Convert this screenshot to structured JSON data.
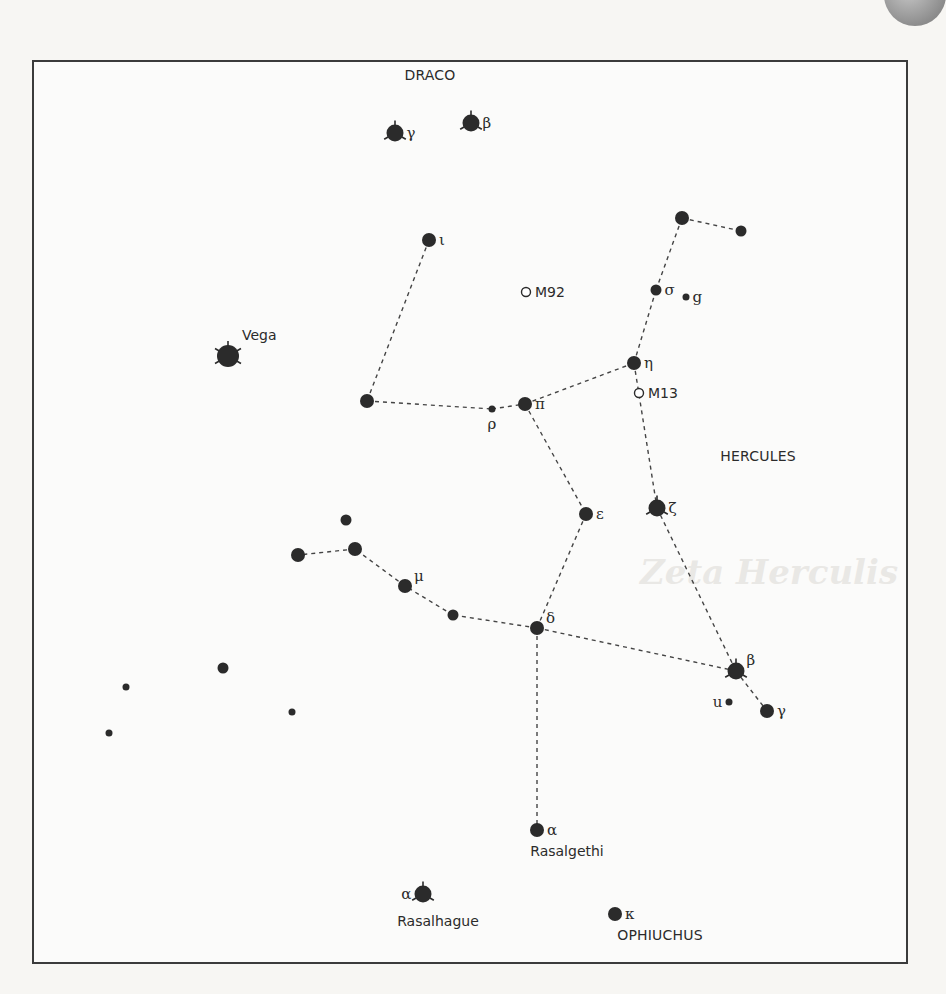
{
  "figure": {
    "constellations": [
      {
        "name": "DRACO",
        "x": 430,
        "y": 80
      },
      {
        "name": "HERCULES",
        "x": 758,
        "y": 461
      },
      {
        "name": "OPHIUCHUS",
        "x": 660,
        "y": 940
      }
    ],
    "stars": [
      {
        "id": "dra-gamma",
        "x": 395,
        "y": 133,
        "mag": "bright",
        "spiked": true,
        "label": "γ",
        "labelPos": "right"
      },
      {
        "id": "dra-beta",
        "x": 471,
        "y": 123,
        "mag": "bright",
        "spiked": true,
        "label": "β",
        "labelPos": "right"
      },
      {
        "id": "her-iota",
        "x": 429,
        "y": 240,
        "mag": "medium",
        "label": "ι",
        "labelPos": "right"
      },
      {
        "id": "vega",
        "x": 228,
        "y": 356,
        "mag": "brightest",
        "spiked": true,
        "label": "Vega",
        "labelPos": "upright",
        "named": true
      },
      {
        "id": "her-theta",
        "x": 367,
        "y": 401,
        "mag": "medium",
        "label": "",
        "labelPos": "right"
      },
      {
        "id": "her-rho",
        "x": 492,
        "y": 409,
        "mag": "small",
        "label": "ρ",
        "labelPos": "below"
      },
      {
        "id": "her-pi",
        "x": 525,
        "y": 404,
        "mag": "medium",
        "label": "π",
        "labelPos": "right"
      },
      {
        "id": "her-eta",
        "x": 634,
        "y": 363,
        "mag": "medium",
        "label": "η",
        "labelPos": "right"
      },
      {
        "id": "her-sigma",
        "x": 656,
        "y": 290,
        "mag": "medium-small",
        "label": "σ",
        "labelPos": "right"
      },
      {
        "id": "her-g",
        "x": 686,
        "y": 297,
        "mag": "small",
        "label": "g",
        "labelPos": "right"
      },
      {
        "id": "her-tau",
        "x": 682,
        "y": 218,
        "mag": "medium",
        "label": "",
        "labelPos": "right"
      },
      {
        "id": "her-phi",
        "x": 741,
        "y": 231,
        "mag": "medium-small",
        "label": "",
        "labelPos": "right"
      },
      {
        "id": "her-epsilon",
        "x": 586,
        "y": 514,
        "mag": "medium",
        "label": "ε",
        "labelPos": "right"
      },
      {
        "id": "her-zeta",
        "x": 657,
        "y": 508,
        "mag": "bright",
        "spiked": true,
        "label": "ζ",
        "labelPos": "right"
      },
      {
        "id": "her-delta",
        "x": 537,
        "y": 628,
        "mag": "medium",
        "label": "δ",
        "labelPos": "upright"
      },
      {
        "id": "her-lambda",
        "x": 453,
        "y": 615,
        "mag": "medium-small",
        "label": "",
        "labelPos": "right"
      },
      {
        "id": "her-mu",
        "x": 405,
        "y": 586,
        "mag": "medium",
        "label": "μ",
        "labelPos": "upright"
      },
      {
        "id": "her-xi",
        "x": 355,
        "y": 549,
        "mag": "medium",
        "label": "",
        "labelPos": "right"
      },
      {
        "id": "her-nu",
        "x": 298,
        "y": 555,
        "mag": "medium",
        "label": "",
        "labelPos": "right"
      },
      {
        "id": "her-omicron",
        "x": 346,
        "y": 520,
        "mag": "medium-small",
        "label": "",
        "labelPos": "right"
      },
      {
        "id": "her-beta",
        "x": 736,
        "y": 671,
        "mag": "bright",
        "spiked": true,
        "label": "β",
        "labelPos": "upright"
      },
      {
        "id": "her-gamma",
        "x": 767,
        "y": 711,
        "mag": "medium",
        "label": "γ",
        "labelPos": "right"
      },
      {
        "id": "her-u",
        "x": 729,
        "y": 702,
        "mag": "small",
        "label": "u",
        "labelPos": "left"
      },
      {
        "id": "her-alpha",
        "x": 537,
        "y": 830,
        "mag": "medium",
        "label": "α",
        "labelPos": "right"
      },
      {
        "id": "oph-alpha",
        "x": 423,
        "y": 894,
        "mag": "bright",
        "spiked": true,
        "label": "α",
        "labelPos": "left"
      },
      {
        "id": "oph-kappa",
        "x": 615,
        "y": 914,
        "mag": "medium",
        "label": "κ",
        "labelPos": "right"
      },
      {
        "id": "field-1",
        "x": 223,
        "y": 668,
        "mag": "medium-small",
        "label": ""
      },
      {
        "id": "field-2",
        "x": 126,
        "y": 687,
        "mag": "small",
        "label": ""
      },
      {
        "id": "field-3",
        "x": 292,
        "y": 712,
        "mag": "small",
        "label": ""
      },
      {
        "id": "field-4",
        "x": 109,
        "y": 733,
        "mag": "small",
        "label": ""
      }
    ],
    "clusters": [
      {
        "id": "M92",
        "x": 526,
        "y": 292,
        "label": "M92"
      },
      {
        "id": "M13",
        "x": 639,
        "y": 393,
        "label": "M13"
      }
    ],
    "named_labels": [
      {
        "text": "Rasalgethi",
        "x": 567,
        "y": 856
      },
      {
        "text": "Rasalhague",
        "x": 438,
        "y": 926
      }
    ],
    "lines": [
      [
        "her-iota",
        "her-theta"
      ],
      [
        "her-theta",
        "her-rho"
      ],
      [
        "her-rho",
        "her-pi"
      ],
      [
        "her-pi",
        "her-eta"
      ],
      [
        "her-eta",
        "her-sigma"
      ],
      [
        "her-sigma",
        "her-tau"
      ],
      [
        "her-tau",
        "her-phi"
      ],
      [
        "her-eta",
        "her-zeta"
      ],
      [
        "her-pi",
        "her-epsilon"
      ],
      [
        "her-epsilon",
        "her-delta"
      ],
      [
        "her-zeta",
        "her-beta"
      ],
      [
        "her-beta",
        "her-gamma"
      ],
      [
        "her-delta",
        "her-beta"
      ],
      [
        "her-delta",
        "her-lambda"
      ],
      [
        "her-lambda",
        "her-mu"
      ],
      [
        "her-mu",
        "her-xi"
      ],
      [
        "her-xi",
        "her-nu"
      ],
      [
        "her-delta",
        "her-alpha"
      ]
    ]
  },
  "background_text": {
    "heading": "Zeta Herculis"
  },
  "colors": {
    "ink": "#2b2b2b",
    "frame": "#3b3b3b"
  }
}
